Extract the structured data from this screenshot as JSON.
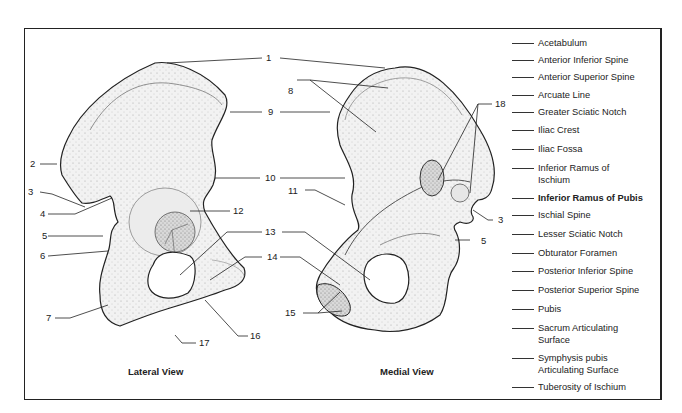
{
  "diagram": {
    "views": [
      {
        "id": "lateral",
        "label": "Lateral View"
      },
      {
        "id": "medial",
        "label": "Medial View"
      }
    ],
    "callouts": {
      "n1": "1",
      "n2": "2",
      "n3a": "3",
      "n3b": "3",
      "n4": "4",
      "n5a": "5",
      "n5b": "5",
      "n6": "6",
      "n7": "7",
      "n8": "8",
      "n9": "9",
      "n10": "10",
      "n11": "11",
      "n12": "12",
      "n13": "13",
      "n14": "14",
      "n15": "15",
      "n16": "16",
      "n17": "17",
      "n18": "18"
    },
    "legend": [
      {
        "label": "Acetabulum"
      },
      {
        "label": "Anterior Inferior Spine"
      },
      {
        "label": "Anterior Superior Spine"
      },
      {
        "label": "Arcuate Line"
      },
      {
        "label": "Greater Sciatic Notch"
      },
      {
        "label": "Iliac Crest"
      },
      {
        "label": "Iliac Fossa"
      },
      {
        "label": "Inferior Ramus of\n Ischium"
      },
      {
        "label": "Inferior Ramus of Pubis"
      },
      {
        "label": "Ischial Spine"
      },
      {
        "label": "Lesser Sciatic Notch"
      },
      {
        "label": "Obturator Foramen"
      },
      {
        "label": "Posterior Inferior Spine"
      },
      {
        "label": "Posterior Superior Spine"
      },
      {
        "label": "Pubis"
      },
      {
        "label": "Sacrum Articulating\n Surface"
      },
      {
        "label": "Symphysis pubis\n Articulating Surface"
      },
      {
        "label": "Tuberosity of Ischium"
      }
    ],
    "colors": {
      "ink": "#222222",
      "bone_fill": "#f1f1f1",
      "bone_shade": "#dcdcdc",
      "background": "#ffffff"
    }
  }
}
